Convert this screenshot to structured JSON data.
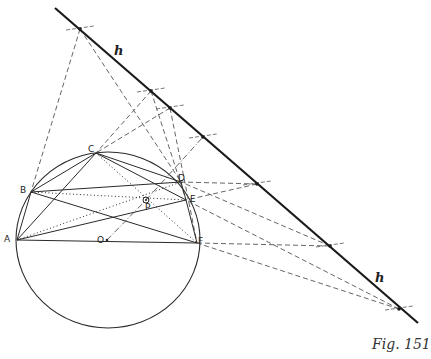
{
  "caption": "Fig. 151",
  "line_label": "h",
  "points": {
    "A": {
      "label": "A",
      "x": 17,
      "y": 240,
      "lx": 4,
      "ly": 235
    },
    "B": {
      "label": "B",
      "x": 31,
      "y": 192,
      "lx": 20,
      "ly": 186
    },
    "C": {
      "label": "C",
      "x": 96,
      "y": 153,
      "lx": 88,
      "ly": 145
    },
    "D": {
      "label": "D",
      "x": 181,
      "y": 182,
      "lx": 178,
      "ly": 174
    },
    "E": {
      "label": "E",
      "x": 186,
      "y": 200,
      "lx": 190,
      "ly": 195
    },
    "F": {
      "label": "F",
      "x": 197,
      "y": 243,
      "lx": 198,
      "ly": 237
    },
    "O": {
      "label": "O",
      "x": 107,
      "y": 240,
      "lx": 97,
      "ly": 236
    },
    "P": {
      "label": "P",
      "x": 146,
      "y": 200,
      "lx": 145,
      "ly": 203
    }
  },
  "circle": {
    "cx": 108,
    "cy": 240,
    "rx": 92,
    "ry": 88
  },
  "line_h": {
    "x1": 55,
    "y1": 8,
    "x2": 418,
    "y2": 323
  },
  "h_points": [
    {
      "x": 80,
      "y": 29
    },
    {
      "x": 151,
      "y": 91
    },
    {
      "x": 170,
      "y": 108
    },
    {
      "x": 203,
      "y": 137
    },
    {
      "x": 257,
      "y": 184
    },
    {
      "x": 330,
      "y": 246
    },
    {
      "x": 399,
      "y": 309
    }
  ],
  "h_label_positions": [
    {
      "x": 114,
      "y": 44
    },
    {
      "x": 375,
      "y": 271
    }
  ],
  "solid_segments": [
    [
      "A",
      "B"
    ],
    [
      "B",
      "C"
    ],
    [
      "C",
      "D"
    ],
    [
      "D",
      "E"
    ],
    [
      "E",
      "F"
    ],
    [
      "A",
      "F"
    ],
    [
      "A",
      "C"
    ],
    [
      "C",
      "E"
    ],
    [
      "B",
      "D"
    ],
    [
      "B",
      "F"
    ],
    [
      "A",
      "E"
    ],
    [
      "C",
      "F"
    ]
  ],
  "dotted_segments": [
    [
      "B",
      "E"
    ],
    [
      "A",
      "D"
    ],
    [
      "C",
      "F"
    ]
  ],
  "dashed_lines": [
    {
      "x1": 80,
      "y1": 29,
      "x2": 31,
      "y2": 192
    },
    {
      "x1": 80,
      "y1": 29,
      "x2": 181,
      "y2": 182
    },
    {
      "x1": 151,
      "y1": 91,
      "x2": 96,
      "y2": 153
    },
    {
      "x1": 151,
      "y1": 91,
      "x2": 186,
      "y2": 200
    },
    {
      "x1": 170,
      "y1": 108,
      "x2": 96,
      "y2": 153
    },
    {
      "x1": 170,
      "y1": 108,
      "x2": 197,
      "y2": 243
    },
    {
      "x1": 257,
      "y1": 184,
      "x2": 181,
      "y2": 182
    },
    {
      "x1": 257,
      "y1": 184,
      "x2": 186,
      "y2": 200
    },
    {
      "x1": 330,
      "y1": 246,
      "x2": 197,
      "y2": 243
    },
    {
      "x1": 330,
      "y1": 246,
      "x2": 181,
      "y2": 182
    },
    {
      "x1": 399,
      "y1": 309,
      "x2": 186,
      "y2": 200
    },
    {
      "x1": 399,
      "y1": 309,
      "x2": 197,
      "y2": 243
    }
  ],
  "dashdot_lines": [
    {
      "x1": 107,
      "y1": 240,
      "x2": 146,
      "y2": 200
    },
    {
      "x1": 146,
      "y1": 200,
      "x2": 203,
      "y2": 137
    }
  ],
  "colors": {
    "ink": "#2a2a2a",
    "faint": "#555555"
  }
}
